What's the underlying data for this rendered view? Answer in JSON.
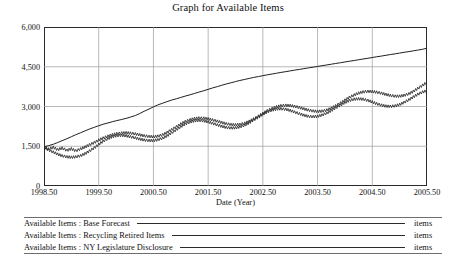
{
  "chart_data": {
    "type": "line",
    "title": "Graph for Available Items",
    "xlabel": "Date (Year)",
    "ylabel": "",
    "unit": "items",
    "grid": true,
    "legend_position": "bottom",
    "xlim": [
      1998.5,
      2005.5
    ],
    "ylim": [
      0,
      6000
    ],
    "xticks": [
      "1998.50",
      "1999.50",
      "2000.50",
      "2001.50",
      "2002.50",
      "2003.50",
      "2004.50",
      "2005.50"
    ],
    "xtick_values": [
      1998.5,
      1999.5,
      2000.5,
      2001.5,
      2002.5,
      2003.5,
      2004.5,
      2005.5
    ],
    "yticks": [
      "0",
      "1,500",
      "3,000",
      "4,500",
      "6,000"
    ],
    "ytick_values": [
      0,
      1500,
      3000,
      4500,
      6000
    ],
    "x": [
      1998.5,
      1998.58,
      1998.67,
      1998.75,
      1998.83,
      1998.92,
      1999.0,
      1999.08,
      1999.17,
      1999.25,
      1999.33,
      1999.42,
      1999.5,
      1999.58,
      1999.67,
      1999.75,
      1999.83,
      1999.92,
      2000.0,
      2000.08,
      2000.17,
      2000.25,
      2000.33,
      2000.42,
      2000.5,
      2000.58,
      2000.67,
      2000.75,
      2000.83,
      2000.92,
      2001.0,
      2001.08,
      2001.17,
      2001.25,
      2001.33,
      2001.42,
      2001.5,
      2001.58,
      2001.67,
      2001.75,
      2001.83,
      2001.92,
      2002.0,
      2002.08,
      2002.17,
      2002.25,
      2002.33,
      2002.42,
      2002.5,
      2002.58,
      2002.67,
      2002.75,
      2002.83,
      2002.92,
      2003.0,
      2003.08,
      2003.17,
      2003.25,
      2003.33,
      2003.42,
      2003.5,
      2003.58,
      2003.67,
      2003.75,
      2003.83,
      2003.92,
      2004.0,
      2004.08,
      2004.17,
      2004.25,
      2004.33,
      2004.42,
      2004.5,
      2004.58,
      2004.67,
      2004.75,
      2004.83,
      2004.92,
      2005.0,
      2005.08,
      2005.17,
      2005.25,
      2005.33,
      2005.42,
      2005.5
    ],
    "series": [
      {
        "name": "Available Items : Base Forecast",
        "style": "solid",
        "color": "#1f1f1f",
        "values": [
          1480,
          1520,
          1575,
          1640,
          1710,
          1785,
          1860,
          1935,
          2010,
          2080,
          2150,
          2215,
          2275,
          2330,
          2380,
          2425,
          2468,
          2510,
          2552,
          2600,
          2660,
          2735,
          2820,
          2905,
          2985,
          3060,
          3125,
          3185,
          3240,
          3292,
          3342,
          3392,
          3442,
          3492,
          3543,
          3595,
          3648,
          3700,
          3752,
          3802,
          3850,
          3896,
          3940,
          3982,
          4022,
          4060,
          4096,
          4130,
          4163,
          4195,
          4226,
          4256,
          4286,
          4315,
          4344,
          4372,
          4400,
          4428,
          4456,
          4484,
          4512,
          4540,
          4568,
          4596,
          4624,
          4652,
          4680,
          4708,
          4736,
          4764,
          4792,
          4820,
          4848,
          4876,
          4904,
          4932,
          4960,
          4988,
          5016,
          5044,
          5072,
          5100,
          5128,
          5160,
          5200
        ]
      },
      {
        "name": "Available Items : Recycling Retired Items",
        "style": "solid",
        "color": "#2b2b2b",
        "values": [
          1470,
          1395,
          1460,
          1370,
          1430,
          1345,
          1405,
          1330,
          1400,
          1470,
          1555,
          1640,
          1730,
          1810,
          1880,
          1935,
          1975,
          2000,
          2010,
          1995,
          1965,
          1930,
          1895,
          1870,
          1860,
          1880,
          1935,
          2020,
          2125,
          2235,
          2340,
          2430,
          2500,
          2545,
          2565,
          2560,
          2535,
          2495,
          2445,
          2395,
          2350,
          2320,
          2310,
          2325,
          2370,
          2440,
          2530,
          2635,
          2740,
          2840,
          2925,
          2990,
          3030,
          3045,
          3035,
          3005,
          2960,
          2910,
          2865,
          2830,
          2815,
          2825,
          2865,
          2935,
          3025,
          3130,
          3240,
          3345,
          3435,
          3505,
          3550,
          3570,
          3565,
          3540,
          3500,
          3455,
          3415,
          3390,
          3390,
          3420,
          3480,
          3570,
          3680,
          3800,
          3910
        ]
      },
      {
        "name": "Available Items : NY Legislature Disclosure",
        "style": "solid",
        "color": "#2b2b2b",
        "values": [
          1460,
          1360,
          1280,
          1200,
          1140,
          1100,
          1085,
          1100,
          1145,
          1220,
          1320,
          1440,
          1570,
          1690,
          1790,
          1860,
          1900,
          1910,
          1895,
          1860,
          1815,
          1770,
          1735,
          1715,
          1715,
          1745,
          1805,
          1895,
          2005,
          2125,
          2240,
          2340,
          2415,
          2460,
          2475,
          2460,
          2420,
          2365,
          2305,
          2250,
          2210,
          2190,
          2195,
          2230,
          2295,
          2385,
          2490,
          2600,
          2705,
          2795,
          2865,
          2905,
          2915,
          2895,
          2850,
          2790,
          2725,
          2670,
          2630,
          2615,
          2630,
          2675,
          2750,
          2845,
          2950,
          3055,
          3150,
          3225,
          3275,
          3290,
          3275,
          3230,
          3170,
          3105,
          3050,
          3015,
          3005,
          3025,
          3075,
          3155,
          3255,
          3360,
          3460,
          3545,
          3600
        ]
      }
    ]
  },
  "legend": {
    "rows": [
      {
        "label": "Available Items : Base Forecast",
        "unit": "items"
      },
      {
        "label": "Available Items : Recycling Retired Items",
        "unit": "items"
      },
      {
        "label": "Available Items : NY Legislature Disclosure",
        "unit": "items"
      }
    ]
  },
  "colors": {
    "frame": "#2a2a2a",
    "grid": "#9a9a9a",
    "curve": "#2b2b2b",
    "background": "#ffffff"
  }
}
